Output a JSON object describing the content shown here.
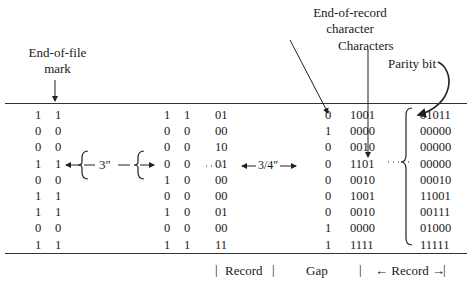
{
  "labels": {
    "end_of_file": [
      "End-of-file",
      "mark"
    ],
    "end_of_record": [
      "End-of-record",
      "character"
    ],
    "characters": "Characters",
    "parity_bit": "Parity bit",
    "gap_long": "3″",
    "gap_short": "3/4″"
  },
  "footer": {
    "record1": "Record",
    "gap": "Gap",
    "record2": "← Record →"
  },
  "columns": {
    "eof_a": [
      "1",
      "0",
      "0",
      "1",
      "0",
      "1",
      "1",
      "0",
      "1"
    ],
    "eof_b": [
      "1",
      "0",
      "0",
      "1",
      "0",
      "1",
      "1",
      "0",
      "1"
    ],
    "rec1_a": [
      "1",
      "0",
      "0",
      "0",
      "1",
      "0",
      "1",
      "0",
      "1"
    ],
    "rec1_b": [
      "1",
      "0",
      "0",
      "0",
      "0",
      "0",
      "0",
      "0",
      "1"
    ],
    "rec1_c": [
      "01",
      "00",
      "10",
      "01",
      "00",
      "00",
      "01",
      "00",
      "11"
    ],
    "eor": [
      "0",
      "1",
      "0",
      "0",
      "0",
      "0",
      "0",
      "1",
      "1"
    ],
    "rec2_a": [
      "1001",
      "0000",
      "0010",
      "1101",
      "0010",
      "1001",
      "0010",
      "0000",
      "1111"
    ],
    "rec2_b": [
      "01011",
      "00000",
      "00000",
      "00000",
      "00010",
      "11001",
      "00111",
      "01000",
      "11111"
    ]
  }
}
